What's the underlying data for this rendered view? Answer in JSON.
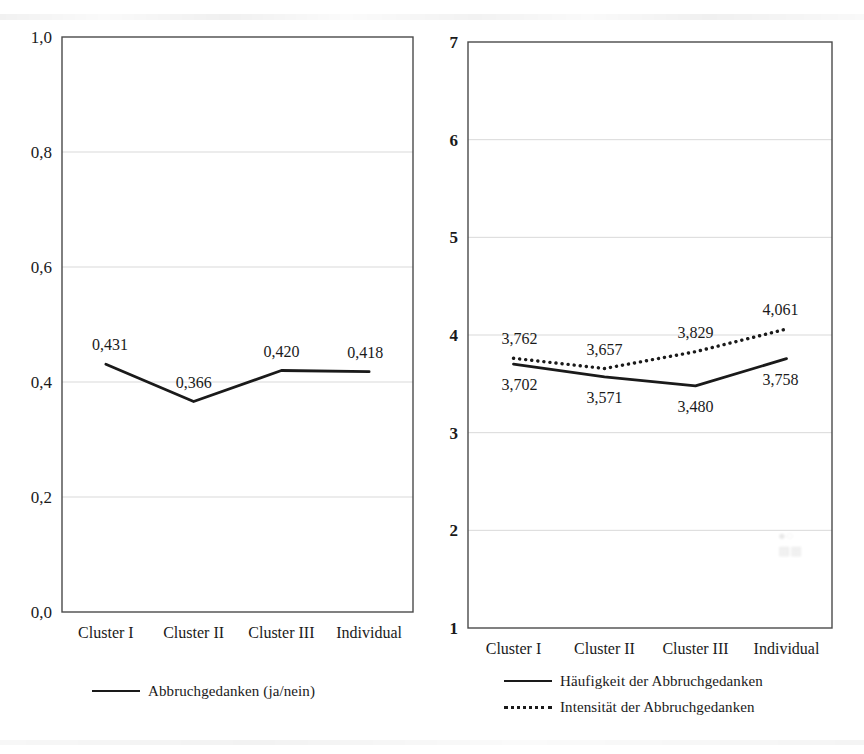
{
  "figure": {
    "background_color": "#ffffff",
    "line_color": "#1a1a1a",
    "gridline_color": "#d9d9d9",
    "axis_color": "#4a4a4a"
  },
  "charts": [
    {
      "id": "left",
      "chart_data": {
        "type": "line",
        "title": "",
        "xlabel": "",
        "ylabel": "",
        "categories": [
          "Cluster I",
          "Cluster II",
          "Cluster III",
          "Individual"
        ],
        "ytick_labels": [
          "1,0",
          "0,8",
          "0,6",
          "0,4",
          "0,2",
          "0,0"
        ],
        "ytick_values": [
          1.0,
          0.8,
          0.6,
          0.4,
          0.2,
          0.0
        ],
        "ylim": [
          0.0,
          1.0
        ],
        "grid": true,
        "grid_axis": "y",
        "legend_position": "bottom",
        "series": [
          {
            "name": "Abbruchgedanken (ja/nein)",
            "style": "solid",
            "values": [
              0.431,
              0.366,
              0.42,
              0.418
            ],
            "data_labels": [
              "0,431",
              "0,366",
              "0,420",
              "0,418"
            ],
            "label_positions": [
              "above",
              "above",
              "above",
              "above"
            ]
          }
        ]
      },
      "legend": [
        {
          "label": "Abbruchgedanken (ja/nein)",
          "style": "solid"
        }
      ]
    },
    {
      "id": "right",
      "chart_data": {
        "type": "line",
        "title": "",
        "xlabel": "",
        "ylabel": "",
        "categories": [
          "Cluster I",
          "Cluster II",
          "Cluster III",
          "Individual"
        ],
        "ytick_labels": [
          "7",
          "6",
          "5",
          "4",
          "3",
          "2",
          "1"
        ],
        "ytick_values": [
          7,
          6,
          5,
          4,
          3,
          2,
          1
        ],
        "ylim": [
          1,
          7
        ],
        "grid": true,
        "grid_axis": "y",
        "legend_position": "bottom",
        "series": [
          {
            "name": "Häufigkeit der Abbruchgedanken",
            "style": "solid",
            "values": [
              3.702,
              3.571,
              3.48,
              3.758
            ],
            "data_labels": [
              "3,702",
              "3,571",
              "3,480",
              "3,758"
            ],
            "label_positions": [
              "below",
              "below",
              "below",
              "below"
            ]
          },
          {
            "name": "Intensität der Abbruchgedanken",
            "style": "dotted",
            "values": [
              3.762,
              3.657,
              3.829,
              4.061
            ],
            "data_labels": [
              "3,762",
              "3,657",
              "3,829",
              "4,061"
            ],
            "label_positions": [
              "above",
              "above",
              "above",
              "above"
            ]
          }
        ]
      },
      "legend": [
        {
          "label": "Häufigkeit der Abbruchgedanken",
          "style": "solid"
        },
        {
          "label": "Intensität der Abbruchgedanken",
          "style": "dotted"
        }
      ]
    }
  ]
}
